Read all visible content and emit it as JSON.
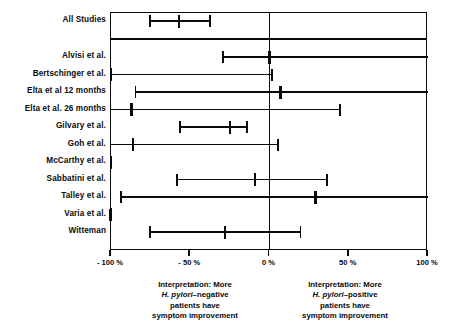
{
  "chart_data": {
    "type": "forest",
    "title": "",
    "xlabel": "",
    "ylabel": "",
    "xlim": [
      -100,
      100
    ],
    "xunit": "%",
    "grid": false,
    "legend": "none",
    "reference_line": 0,
    "tick_values": [
      -100,
      -50,
      0,
      50,
      100
    ],
    "tick_labels": [
      "- 100 %",
      "- 50 %",
      "0 %",
      "50 %",
      "100 %"
    ],
    "categories": [
      "All Studies",
      "Alvisi et al.",
      "Bertschinger et al.",
      "Elta et al 12 months",
      "Elta et al. 26 months",
      "Gilvary et al.",
      "Goh et al.",
      "McCarthy et al.",
      "Sabbatini et al.",
      "Talley et al.",
      "Varia et al.",
      "Witteman"
    ],
    "rows": [
      {
        "label": "All Studies",
        "estimate": -57,
        "low": -76,
        "high": -37,
        "summary": true
      },
      {
        "label": "Alvisi et al.",
        "estimate": 0,
        "low": -30,
        "high": 132,
        "summary": false
      },
      {
        "label": "Bertschinger et al.",
        "estimate": -119,
        "low": -169,
        "high": 2,
        "summary": false
      },
      {
        "label": "Elta et al 12 months",
        "estimate": 7,
        "low": -85,
        "high": 111,
        "summary": false
      },
      {
        "label": "Elta et al. 26 months",
        "estimate": -87,
        "low": -163,
        "high": 45,
        "summary": false
      },
      {
        "label": "Gilvary et al.",
        "estimate": -25,
        "low": -57,
        "high": -14,
        "summary": false
      },
      {
        "label": "Goh et al.",
        "estimate": -86,
        "low": -163,
        "high": 6,
        "summary": false
      },
      {
        "label": "McCarthy et al.",
        "estimate": -161,
        "low": -169,
        "high": -118,
        "summary": false
      },
      {
        "label": "Sabbatini et al.",
        "estimate": -9,
        "low": -59,
        "high": 37,
        "summary": false
      },
      {
        "label": "Talley et al.",
        "estimate": 29,
        "low": -94,
        "high": 134,
        "summary": false
      },
      {
        "label": "Varia et al.",
        "estimate": -140,
        "low": -165,
        "high": -100,
        "summary": false
      },
      {
        "label": "Witteman",
        "estimate": -28,
        "low": -76,
        "high": 20,
        "summary": false
      }
    ]
  },
  "interpretation": {
    "left": {
      "line1": "Interpretation:  More",
      "line2_italic": "H. pylori",
      "line2_rest": "–negative",
      "line3": "patients have",
      "line4": "symptom improvement"
    },
    "right": {
      "line1": "Interpretation:  More",
      "line2_italic": "H. pylori",
      "line2_rest": "–positive",
      "line3": "patients have",
      "line4": "symptom improvement"
    }
  },
  "style": {
    "ink": "#0a0a0a",
    "paper": "#ffffff"
  }
}
